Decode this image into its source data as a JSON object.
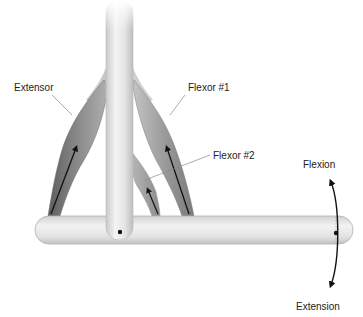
{
  "diagram": {
    "type": "anatomical-lever-schematic",
    "labels": {
      "extensor": "Extensor",
      "flexor1": "Flexor #1",
      "flexor2": "Flexor #2",
      "flexion": "Flexion",
      "extension": "Extension"
    },
    "components": [
      {
        "id": "vertical-bone",
        "role": "proximal bone"
      },
      {
        "id": "horizontal-bone",
        "role": "distal bone / lever"
      },
      {
        "id": "extensor-muscle",
        "label_key": "extensor",
        "force_direction": "upward"
      },
      {
        "id": "flexor1-muscle",
        "label_key": "flexor1",
        "force_direction": "upward"
      },
      {
        "id": "flexor2-muscle",
        "label_key": "flexor2",
        "force_direction": "upward"
      },
      {
        "id": "joint-pivot",
        "role": "joint axis"
      },
      {
        "id": "rotation-arrow",
        "directions": [
          "flexion",
          "extension"
        ]
      }
    ],
    "colors": {
      "bone_light": "#f2f2f2",
      "bone_mid": "#d9d9d9",
      "bone_edge": "#b5b5b5",
      "muscle_dark": "#6e6e6e",
      "muscle_mid": "#9a9a9a",
      "muscle_light": "#c4c4c4",
      "arrow": "#111111",
      "leader": "#888888"
    }
  }
}
